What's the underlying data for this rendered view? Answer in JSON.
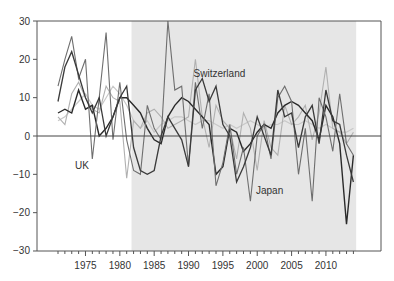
{
  "chart_data": {
    "type": "line",
    "title": "",
    "xlabel": "",
    "ylabel": "",
    "xlim": [
      1970,
      2015
    ],
    "ylim": [
      -30,
      30
    ],
    "yticks": [
      30,
      20,
      10,
      0,
      -10,
      -20,
      -30
    ],
    "yticklabels": [
      "30",
      "20",
      "10",
      "0",
      "−10",
      "−20",
      "−30"
    ],
    "xticks": [
      1975,
      1980,
      1985,
      1990,
      1995,
      2000,
      2005,
      2010
    ],
    "xticklabels": [
      "1975",
      "1980",
      "1985",
      "1990",
      "1995",
      "2000",
      "2005",
      "2010"
    ],
    "grid": false,
    "legend": "none",
    "shaded_region": {
      "from": 1981.7,
      "to": 2014.4,
      "color": "#e6e6e6"
    },
    "zero_line": true,
    "annotations": [
      {
        "text": "Switzerland",
        "year": 1994.5,
        "value": 15.5
      },
      {
        "text": "UK",
        "year": 1974.5,
        "value": -8.5
      },
      {
        "text": "Japan",
        "year": 2001.8,
        "value": -15.2
      }
    ],
    "x": [
      1971,
      1972,
      1973,
      1974,
      1975,
      1976,
      1977,
      1978,
      1979,
      1980,
      1981,
      1982,
      1983,
      1984,
      1985,
      1986,
      1987,
      1988,
      1989,
      1990,
      1991,
      1992,
      1993,
      1994,
      1995,
      1996,
      1997,
      1998,
      1999,
      2000,
      2001,
      2002,
      2003,
      2004,
      2005,
      2006,
      2007,
      2008,
      2009,
      2010,
      2011,
      2012,
      2013,
      2014
    ],
    "series": [
      {
        "name": "Switzerland",
        "color": "#3a3a3a",
        "width": 1.3,
        "values": [
          9,
          18,
          22,
          16,
          10,
          6,
          10,
          0,
          5,
          10,
          13,
          -3,
          -9,
          -10,
          -9,
          0,
          5,
          2,
          -1,
          -8,
          12,
          15,
          9,
          13,
          3,
          0,
          -12,
          -8,
          -3,
          5,
          0,
          -5,
          12,
          5,
          6,
          -3,
          5,
          8,
          -2,
          12,
          4,
          3,
          -5,
          -12
        ]
      },
      {
        "name": "UK",
        "color": "#6e6e6e",
        "width": 1.1,
        "values": [
          13,
          20,
          26,
          15,
          20,
          -6,
          10,
          27,
          -1,
          14,
          -1,
          -9,
          -10,
          8,
          2,
          -1,
          30,
          12,
          13,
          -8,
          14,
          2,
          11,
          -13,
          -7,
          3,
          -10,
          -3,
          -17,
          0,
          3,
          -6,
          10,
          13,
          9,
          -10,
          2,
          -17,
          10,
          5,
          -4,
          11,
          -2,
          -5
        ]
      },
      {
        "name": "Japan",
        "color": "#2a2a2a",
        "width": 1.4,
        "values": [
          6,
          7,
          6,
          12,
          7,
          8,
          0,
          2,
          5,
          10,
          10,
          8,
          6,
          2,
          -1,
          -2,
          5,
          8,
          10,
          9,
          7,
          5,
          3,
          -10,
          -8,
          2,
          1,
          -4,
          -2,
          1,
          3,
          2,
          6,
          8,
          9,
          8,
          6,
          4,
          -1,
          8,
          5,
          -2,
          -23,
          -5
        ]
      },
      {
        "name": "Series 4",
        "color": "#b0b0b0",
        "width": 1.1,
        "values": [
          5,
          3,
          11,
          14,
          10,
          7,
          6,
          13,
          10,
          9,
          -11,
          4,
          2,
          6,
          7,
          5,
          2,
          3,
          4,
          5,
          20,
          5,
          -3,
          8,
          4,
          2,
          -6,
          6,
          2,
          -9,
          4,
          -3,
          -5,
          8,
          3,
          5,
          8,
          -1,
          6,
          18,
          2,
          1,
          -2,
          1
        ]
      },
      {
        "name": "Series 5",
        "color": "#c8c8c8",
        "width": 1.2,
        "values": [
          4,
          5,
          7,
          9,
          11,
          8,
          7,
          10,
          13,
          11,
          8,
          4,
          2,
          4,
          1,
          3,
          4,
          5,
          5,
          4,
          3,
          4,
          4,
          3,
          2,
          3,
          2,
          3,
          4,
          3,
          2,
          3,
          3,
          4,
          3,
          3,
          4,
          3,
          2,
          3,
          2,
          1,
          1,
          2
        ]
      }
    ]
  }
}
